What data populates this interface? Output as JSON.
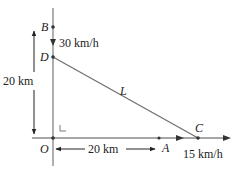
{
  "diagram": {
    "points": {
      "B": {
        "label": "B",
        "x": 53,
        "y": 27
      },
      "D": {
        "label": "D",
        "x": 53,
        "y": 57
      },
      "O": {
        "label": "O",
        "x": 53,
        "y": 138
      },
      "A": {
        "label": "A",
        "x": 159,
        "y": 138
      },
      "C": {
        "label": "C",
        "x": 198,
        "y": 138
      }
    },
    "line_label": "L",
    "vertical_speed": "30 km/h",
    "horizontal_speed": "15 km/h",
    "vertical_distance": "20 km",
    "horizontal_distance": "20 km",
    "right_angle_mark": "∟",
    "colors": {
      "axis": "#7a7a7a",
      "line": "#6e6e6e",
      "text": "#222222",
      "point": "#333333"
    }
  }
}
